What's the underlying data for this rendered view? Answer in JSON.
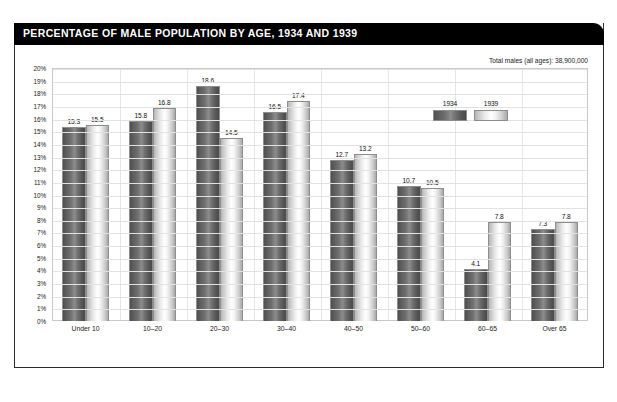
{
  "header": {
    "title": "PERCENTAGE OF MALE POPULATION BY AGE, 1934 AND 1939"
  },
  "annotation": {
    "total_males": "Total males (all ages): 38,900,000"
  },
  "legend": {
    "position": "inside-top-right",
    "entries": [
      {
        "label": "1934",
        "swatch": "dark"
      },
      {
        "label": "1939",
        "swatch": "light"
      }
    ]
  },
  "colors": {
    "title_bar_background": "#000000",
    "title_text": "#ffffff",
    "frame_border": "#2b2b2b",
    "plot_border": "#c8c8c8",
    "gridline": "#e2e2e2",
    "series_1934": "#6e6e6e",
    "series_1939": "#e8e8e8",
    "bar_outline": "#8d8d8d",
    "axis_text": "#222222",
    "page_background": "#ffffff"
  },
  "chart_data": {
    "type": "bar",
    "title": "PERCENTAGE OF MALE POPULATION BY AGE, 1934 AND 1939",
    "subtitle": "",
    "xlabel": "",
    "ylabel": "",
    "grid": true,
    "legend_position": "inside-top-right",
    "categories": [
      "Under 10",
      "10–20",
      "20–30",
      "30–40",
      "40–50",
      "50–60",
      "60–65",
      "Over 65"
    ],
    "series": [
      {
        "name": "1934",
        "values": [
          15.3,
          15.8,
          18.6,
          16.5,
          12.7,
          10.7,
          4.1,
          7.3
        ]
      },
      {
        "name": "1939",
        "values": [
          15.5,
          16.8,
          14.5,
          17.4,
          13.2,
          10.5,
          7.8,
          7.8
        ]
      }
    ],
    "ylim": [
      0,
      20
    ],
    "yticks": [
      "0%",
      "1%",
      "2%",
      "3%",
      "4%",
      "5%",
      "6%",
      "7%",
      "8%",
      "9%",
      "10%",
      "11%",
      "12%",
      "13%",
      "14%",
      "15%",
      "16%",
      "17%",
      "18%",
      "19%",
      "20%"
    ],
    "ytick_values": [
      0,
      1,
      2,
      3,
      4,
      5,
      6,
      7,
      8,
      9,
      10,
      11,
      12,
      13,
      14,
      15,
      16,
      17,
      18,
      19,
      20
    ],
    "value_label_format": "one-decimal",
    "annotations": [
      "Total males (all ages): 38,900,000"
    ]
  }
}
